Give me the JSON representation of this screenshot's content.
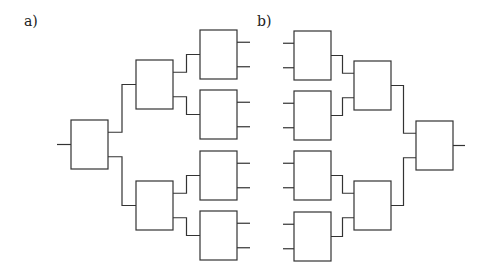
{
  "figure": {
    "panel_a": {
      "label": "a)",
      "description": "Binary tree of boxes branching from a single root on the left to 8 outputs on the right"
    },
    "panel_b": {
      "label": "b)",
      "description": "Mirrored binary tree merging 8 inputs on the left into a single root output on the right"
    }
  },
  "geometry": {
    "box_w": 37,
    "box_h": 49,
    "stroke": "#333333",
    "panel_a": {
      "root": {
        "x": 71,
        "y": 120
      },
      "level2": [
        {
          "x": 136,
          "y": 60
        },
        {
          "x": 136,
          "y": 181
        }
      ],
      "level3": [
        {
          "x": 200,
          "y": 30
        },
        {
          "x": 200,
          "y": 90
        },
        {
          "x": 200,
          "y": 151
        },
        {
          "x": 200,
          "y": 211
        }
      ]
    },
    "panel_b": {
      "level1": [
        {
          "x": 294,
          "y": 31
        },
        {
          "x": 294,
          "y": 91
        },
        {
          "x": 294,
          "y": 151
        },
        {
          "x": 294,
          "y": 212
        }
      ],
      "level2": [
        {
          "x": 354,
          "y": 61
        },
        {
          "x": 354,
          "y": 181
        }
      ],
      "root": {
        "x": 416,
        "y": 121
      }
    }
  }
}
